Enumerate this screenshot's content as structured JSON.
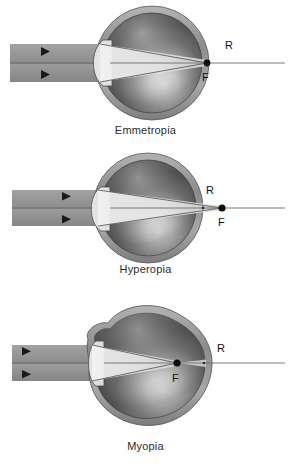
{
  "figure": {
    "background_color": "#ffffff",
    "ink_color": "#333333",
    "beam_color": "#9a9a9a",
    "sclera_color": "#8f8f8f",
    "point_label_color": "#111111"
  },
  "panels": [
    {
      "id": "emmetropia",
      "caption": "Emmetropia",
      "description": "Parallel light rays focus exactly on the retina; the far point R and the focal point F coincide at the retina.",
      "eye_shape": "spherical",
      "labels": {
        "far_point": "R",
        "focal_point": "F"
      },
      "far_point_position": "on-retina",
      "focal_point_position": "on-retina",
      "beam": {
        "arrow_count": 2,
        "direction": "rightward"
      }
    },
    {
      "id": "hyperopia",
      "caption": "Hyperopia",
      "description": "Parallel light rays converge behind the retina; the focal point F lies posterior to the eye while R is at the retina.",
      "eye_shape": "short-spherical",
      "labels": {
        "far_point": "R",
        "focal_point": "F"
      },
      "far_point_position": "on-retina",
      "focal_point_position": "behind-eye",
      "beam": {
        "arrow_count": 2,
        "direction": "rightward"
      }
    },
    {
      "id": "myopia",
      "caption": "Myopia",
      "description": "Parallel light rays converge in front of the retina; the focal point F lies inside the vitreous while R is at the retina of the elongated globe.",
      "eye_shape": "elongated-oval",
      "labels": {
        "far_point": "R",
        "focal_point": "F"
      },
      "far_point_position": "on-retina",
      "focal_point_position": "in-front-of-retina",
      "beam": {
        "arrow_count": 2,
        "direction": "rightward"
      }
    }
  ]
}
